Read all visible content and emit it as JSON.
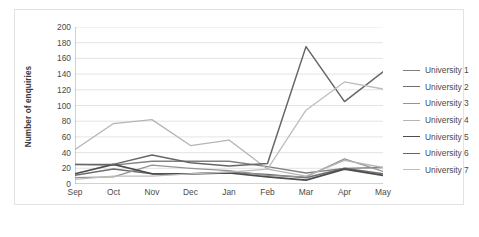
{
  "chart_data": {
    "type": "line",
    "title": "",
    "xlabel": "",
    "ylabel": "Number of enquiries",
    "categories": [
      "Sep",
      "Oct",
      "Nov",
      "Dec",
      "Jan",
      "Feb",
      "Mar",
      "Apr",
      "May"
    ],
    "ylim": [
      0,
      200
    ],
    "ytick_step": 20,
    "yticks": [
      200,
      180,
      160,
      140,
      120,
      100,
      80,
      60,
      40,
      20,
      0
    ],
    "grid": "horizontal",
    "legend_position": "right",
    "series": [
      {
        "name": "University 1",
        "color": "#808080",
        "width": 1.3,
        "values": [
          25,
          24,
          29,
          29,
          29,
          22,
          14,
          20,
          21
        ]
      },
      {
        "name": "University 2",
        "color": "#6e6e6e",
        "width": 1.5,
        "values": [
          11,
          19,
          13,
          13,
          15,
          12,
          8,
          20,
          13
        ]
      },
      {
        "name": "University 3",
        "color": "#949494",
        "width": 1.3,
        "values": [
          8,
          9,
          24,
          20,
          17,
          11,
          9,
          32,
          16
        ]
      },
      {
        "name": "University 4",
        "color": "#b5b5b5",
        "width": 1.3,
        "values": [
          44,
          77,
          82,
          49,
          56,
          19,
          10,
          30,
          21
        ]
      },
      {
        "name": "University 5",
        "color": "#4d4d4d",
        "width": 1.7,
        "values": [
          13,
          25,
          13,
          13,
          14,
          9,
          5,
          19,
          11
        ]
      },
      {
        "name": "University 6",
        "color": "#666666",
        "width": 1.5,
        "values": [
          25,
          25,
          37,
          27,
          23,
          26,
          175,
          105,
          143
        ]
      },
      {
        "name": "University 7",
        "color": "#bdbdbd",
        "width": 1.3,
        "values": [
          6,
          10,
          10,
          13,
          15,
          19,
          94,
          130,
          121
        ]
      }
    ]
  }
}
